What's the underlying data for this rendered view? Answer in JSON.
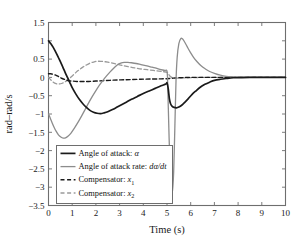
{
  "chart_data": {
    "type": "line",
    "title": "",
    "xlabel": "Time (s)",
    "ylabel": "rad–rad/s",
    "xlim": [
      0,
      10
    ],
    "ylim": [
      -3.5,
      1.5
    ],
    "grid": false,
    "legend_position": "lower left",
    "xticks": [
      "0",
      "1",
      "2",
      "3",
      "4",
      "5",
      "6",
      "7",
      "8",
      "9",
      "10"
    ],
    "yticks": [
      "1.5",
      "1",
      "0.5",
      "0",
      "−0.5",
      "−1",
      "−1.5",
      "−2",
      "−2.5",
      "−3",
      "−3.5"
    ],
    "xtick_values": [
      0,
      1,
      2,
      3,
      4,
      5,
      6,
      7,
      8,
      9,
      10
    ],
    "ytick_values": [
      1.5,
      1,
      0.5,
      0,
      -0.5,
      -1,
      -1.5,
      -2,
      -2.5,
      -3,
      -3.5
    ],
    "series": [
      {
        "name": "Angle of attack: α",
        "legend_label_prefix": "Angle of attack: ",
        "legend_symbol": "α",
        "color": "#1a1a1a",
        "style": "solid",
        "width": 1.7,
        "points": [
          [
            0.0,
            1.0
          ],
          [
            0.1,
            0.92
          ],
          [
            0.2,
            0.82
          ],
          [
            0.3,
            0.7
          ],
          [
            0.4,
            0.57
          ],
          [
            0.5,
            0.43
          ],
          [
            0.6,
            0.29
          ],
          [
            0.7,
            0.14
          ],
          [
            0.8,
            0.0
          ],
          [
            0.9,
            -0.14
          ],
          [
            1.0,
            -0.28
          ],
          [
            1.15,
            -0.45
          ],
          [
            1.3,
            -0.6
          ],
          [
            1.45,
            -0.72
          ],
          [
            1.6,
            -0.82
          ],
          [
            1.75,
            -0.9
          ],
          [
            1.9,
            -0.95
          ],
          [
            2.05,
            -0.98
          ],
          [
            2.2,
            -0.99
          ],
          [
            2.35,
            -0.97
          ],
          [
            2.5,
            -0.94
          ],
          [
            2.7,
            -0.88
          ],
          [
            2.9,
            -0.81
          ],
          [
            3.1,
            -0.74
          ],
          [
            3.3,
            -0.67
          ],
          [
            3.5,
            -0.6
          ],
          [
            3.75,
            -0.52
          ],
          [
            4.0,
            -0.44
          ],
          [
            4.25,
            -0.37
          ],
          [
            4.5,
            -0.3
          ],
          [
            4.75,
            -0.23
          ],
          [
            4.95,
            -0.18
          ],
          [
            5.0,
            -0.15
          ],
          [
            5.05,
            -0.3
          ],
          [
            5.1,
            -0.58
          ],
          [
            5.15,
            -0.72
          ],
          [
            5.22,
            -0.79
          ],
          [
            5.3,
            -0.82
          ],
          [
            5.4,
            -0.83
          ],
          [
            5.5,
            -0.81
          ],
          [
            5.62,
            -0.76
          ],
          [
            5.75,
            -0.68
          ],
          [
            5.9,
            -0.58
          ],
          [
            6.05,
            -0.47
          ],
          [
            6.2,
            -0.38
          ],
          [
            6.4,
            -0.27
          ],
          [
            6.6,
            -0.19
          ],
          [
            6.8,
            -0.13
          ],
          [
            7.0,
            -0.08
          ],
          [
            7.25,
            -0.05
          ],
          [
            7.5,
            -0.03
          ],
          [
            7.8,
            -0.01
          ],
          [
            8.1,
            -0.005
          ],
          [
            8.5,
            0.0
          ],
          [
            9.0,
            0.0
          ],
          [
            9.5,
            0.0
          ],
          [
            10.0,
            0.0
          ]
        ]
      },
      {
        "name": "Angle of attack rate: dα/dt",
        "legend_label_prefix": "Angle of attack rate: ",
        "legend_symbol": "dα/dt",
        "color": "#8c8c8c",
        "style": "solid",
        "width": 1.3,
        "points": [
          [
            0.0,
            -1.0
          ],
          [
            0.08,
            -1.12
          ],
          [
            0.16,
            -1.25
          ],
          [
            0.24,
            -1.37
          ],
          [
            0.32,
            -1.47
          ],
          [
            0.42,
            -1.57
          ],
          [
            0.52,
            -1.63
          ],
          [
            0.62,
            -1.66
          ],
          [
            0.72,
            -1.65
          ],
          [
            0.82,
            -1.61
          ],
          [
            0.95,
            -1.52
          ],
          [
            1.1,
            -1.38
          ],
          [
            1.25,
            -1.22
          ],
          [
            1.4,
            -1.05
          ],
          [
            1.55,
            -0.87
          ],
          [
            1.7,
            -0.69
          ],
          [
            1.85,
            -0.52
          ],
          [
            2.0,
            -0.36
          ],
          [
            2.15,
            -0.21
          ],
          [
            2.3,
            -0.08
          ],
          [
            2.45,
            0.04
          ],
          [
            2.6,
            0.15
          ],
          [
            2.75,
            0.25
          ],
          [
            2.9,
            0.34
          ],
          [
            3.05,
            0.39
          ],
          [
            3.2,
            0.41
          ],
          [
            3.35,
            0.41
          ],
          [
            3.5,
            0.4
          ],
          [
            3.7,
            0.38
          ],
          [
            3.9,
            0.35
          ],
          [
            4.1,
            0.32
          ],
          [
            4.3,
            0.29
          ],
          [
            4.5,
            0.26
          ],
          [
            4.7,
            0.22
          ],
          [
            4.9,
            0.19
          ],
          [
            5.0,
            0.17
          ],
          [
            5.03,
            -0.2
          ],
          [
            5.07,
            -1.2
          ],
          [
            5.12,
            -2.3
          ],
          [
            5.17,
            -2.95
          ],
          [
            5.22,
            -3.15
          ],
          [
            5.28,
            -2.6
          ],
          [
            5.33,
            -1.4
          ],
          [
            5.38,
            -0.1
          ],
          [
            5.43,
            0.55
          ],
          [
            5.5,
            0.92
          ],
          [
            5.58,
            1.06
          ],
          [
            5.66,
            1.05
          ],
          [
            5.75,
            0.96
          ],
          [
            5.85,
            0.84
          ],
          [
            5.98,
            0.69
          ],
          [
            6.12,
            0.55
          ],
          [
            6.28,
            0.42
          ],
          [
            6.45,
            0.31
          ],
          [
            6.62,
            0.23
          ],
          [
            6.8,
            0.16
          ],
          [
            7.0,
            0.11
          ],
          [
            7.25,
            0.06
          ],
          [
            7.5,
            0.03
          ],
          [
            7.8,
            0.015
          ],
          [
            8.1,
            0.005
          ],
          [
            8.5,
            0.0
          ],
          [
            9.0,
            0.0
          ],
          [
            9.5,
            0.0
          ],
          [
            10.0,
            0.0
          ]
        ]
      },
      {
        "name": "Compensator: x1",
        "legend_label_prefix": "Compensator: ",
        "legend_symbol": "x",
        "legend_subscript": "1",
        "color": "#1a1a1a",
        "style": "dashed",
        "width": 1.4,
        "points": [
          [
            0.0,
            0.1
          ],
          [
            0.1,
            0.1
          ],
          [
            0.22,
            0.08
          ],
          [
            0.34,
            0.05
          ],
          [
            0.46,
            0.01
          ],
          [
            0.58,
            -0.03
          ],
          [
            0.7,
            -0.06
          ],
          [
            0.85,
            -0.09
          ],
          [
            1.0,
            -0.1
          ],
          [
            1.2,
            -0.11
          ],
          [
            1.45,
            -0.11
          ],
          [
            1.7,
            -0.11
          ],
          [
            2.0,
            -0.1
          ],
          [
            2.3,
            -0.09
          ],
          [
            2.6,
            -0.08
          ],
          [
            2.9,
            -0.07
          ],
          [
            3.2,
            -0.065
          ],
          [
            3.5,
            -0.06
          ],
          [
            3.9,
            -0.05
          ],
          [
            4.3,
            -0.045
          ],
          [
            4.7,
            -0.04
          ],
          [
            5.0,
            -0.035
          ],
          [
            5.1,
            -0.03
          ],
          [
            5.25,
            -0.02
          ],
          [
            5.45,
            -0.01
          ],
          [
            5.7,
            -0.005
          ],
          [
            6.0,
            0.0
          ],
          [
            6.5,
            0.0
          ],
          [
            7.0,
            0.0
          ],
          [
            8.0,
            0.0
          ],
          [
            9.0,
            0.0
          ],
          [
            10.0,
            0.0
          ]
        ]
      },
      {
        "name": "Compensator: x2",
        "legend_label_prefix": "Compensator: ",
        "legend_symbol": "x",
        "legend_subscript": "2",
        "color": "#9a9a9a",
        "style": "dashed",
        "width": 1.3,
        "points": [
          [
            0.0,
            0.0
          ],
          [
            0.1,
            -0.07
          ],
          [
            0.2,
            -0.13
          ],
          [
            0.32,
            -0.17
          ],
          [
            0.45,
            -0.18
          ],
          [
            0.58,
            -0.16
          ],
          [
            0.7,
            -0.12
          ],
          [
            0.85,
            -0.05
          ],
          [
            1.0,
            0.04
          ],
          [
            1.15,
            0.13
          ],
          [
            1.3,
            0.21
          ],
          [
            1.45,
            0.28
          ],
          [
            1.6,
            0.34
          ],
          [
            1.75,
            0.39
          ],
          [
            1.9,
            0.42
          ],
          [
            2.05,
            0.44
          ],
          [
            2.2,
            0.44
          ],
          [
            2.35,
            0.43
          ],
          [
            2.5,
            0.42
          ],
          [
            2.7,
            0.39
          ],
          [
            2.9,
            0.36
          ],
          [
            3.1,
            0.33
          ],
          [
            3.3,
            0.3
          ],
          [
            3.55,
            0.27
          ],
          [
            3.8,
            0.24
          ],
          [
            4.05,
            0.22
          ],
          [
            4.3,
            0.2
          ],
          [
            4.55,
            0.18
          ],
          [
            4.8,
            0.16
          ],
          [
            5.0,
            0.14
          ],
          [
            5.05,
            0.1
          ],
          [
            5.12,
            0.04
          ],
          [
            5.2,
            0.0
          ],
          [
            5.3,
            -0.02
          ],
          [
            5.45,
            -0.02
          ],
          [
            5.65,
            -0.015
          ],
          [
            5.9,
            -0.01
          ],
          [
            6.2,
            -0.005
          ],
          [
            6.6,
            0.0
          ],
          [
            7.0,
            0.0
          ],
          [
            8.0,
            0.0
          ],
          [
            9.0,
            0.0
          ],
          [
            10.0,
            0.0
          ]
        ]
      }
    ]
  }
}
